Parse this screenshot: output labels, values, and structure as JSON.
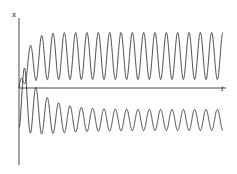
{
  "figure": {
    "title": "",
    "axis_labels": {
      "vertical": "x",
      "horizontal": "t"
    },
    "background_color": "#ffffff",
    "curve_color": "#2b2b2b",
    "axis_color": "#4a4a4a"
  },
  "chart_data": {
    "type": "line",
    "title": "",
    "subtitle": "",
    "xlabel": "t",
    "ylabel": "x",
    "xlim": [
      0,
      1
    ],
    "ylim": [
      -1.6,
      1.6
    ],
    "grid": false,
    "legend": null,
    "annotations": [],
    "axes": {
      "vertical_axis_x_px": 19,
      "horizontal_axis_y_px": 88,
      "vertical_axis_top_px": 18,
      "vertical_axis_bottom_px": 165,
      "horizontal_axis_left_px": 19,
      "horizontal_axis_right_px": 226,
      "plot_left_px": 19,
      "plot_right_px": 223
    },
    "series": [
      {
        "name": "upper-oscillation",
        "description": "Oscillation above the t-axis, rises from origin then sustains nearly constant amplitude",
        "cycles": 18,
        "baseline_y_px": 56,
        "peak_y_px": 33,
        "trough_y_px": 80,
        "start_y_px": 88,
        "amplitude_start": 0.0,
        "amplitude_steady": 1.0,
        "transient_growth": "fast rise within first half cycle",
        "x_start_px": 19,
        "x_end_px": 223
      },
      {
        "name": "lower-oscillation",
        "description": "Oscillation below the t-axis, large initial transient dip then decays to small steady oscillation",
        "cycles": 18,
        "baseline_y_px": 120,
        "peak_y_px": 110,
        "trough_y_px": 131,
        "start_y_px": 90,
        "first_trough_y_px": 143,
        "amplitude_start": 1.0,
        "amplitude_steady": 0.42,
        "transient_decay": "decays over first three cycles",
        "x_start_px": 19,
        "x_end_px": 223
      }
    ]
  }
}
